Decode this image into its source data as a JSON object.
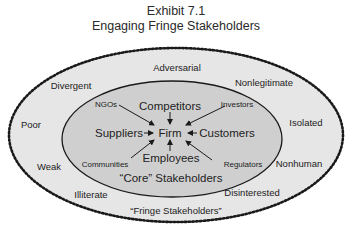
{
  "title": {
    "line1": "Exhibit 7.1",
    "line2": "Engaging Fringe Stakeholders"
  },
  "colors": {
    "outer_fill": "#e6e6e6",
    "inner_fill": "#cfcfcf",
    "outline": "#1a1a1a",
    "text": "#222222"
  },
  "center": {
    "label": "Firm"
  },
  "core_stakeholders": {
    "group_label": "“Core” Stakeholders",
    "major": [
      {
        "label": "Competitors",
        "position": "top"
      },
      {
        "label": "Suppliers",
        "position": "left"
      },
      {
        "label": "Customers",
        "position": "right"
      },
      {
        "label": "Employees",
        "position": "bottom"
      }
    ],
    "minor": [
      {
        "label": "NGOs",
        "position": "top-left"
      },
      {
        "label": "Investors",
        "position": "top-right"
      },
      {
        "label": "Communities",
        "position": "bottom-left"
      },
      {
        "label": "Regulators",
        "position": "bottom-right"
      }
    ]
  },
  "fringe_stakeholders": {
    "group_label": "“Fringe Stakeholders”",
    "attributes": [
      {
        "label": "Adversarial"
      },
      {
        "label": "Divergent"
      },
      {
        "label": "Nonlegitimate"
      },
      {
        "label": "Poor"
      },
      {
        "label": "Isolated"
      },
      {
        "label": "Weak"
      },
      {
        "label": "Nonhuman"
      },
      {
        "label": "Illiterate"
      },
      {
        "label": "Disinterested"
      }
    ]
  }
}
